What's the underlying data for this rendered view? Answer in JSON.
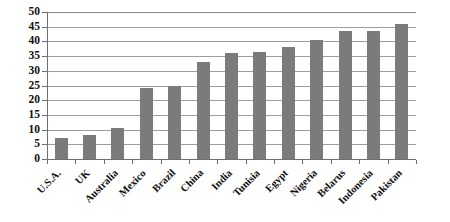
{
  "chart_data": {
    "type": "bar",
    "title": "",
    "subtitle": "",
    "xlabel": "",
    "ylabel": "",
    "ylim": [
      0,
      50
    ],
    "y_ticks": [
      0,
      5,
      10,
      15,
      20,
      25,
      30,
      35,
      40,
      45,
      50
    ],
    "grid": true,
    "legend": false,
    "legend_position": "none",
    "bar_color": "#7b7b7b",
    "categories": [
      "U.S.A.",
      "UK",
      "Australia",
      "Mexico",
      "Brazil",
      "China",
      "India",
      "Tunisia",
      "Egypt",
      "Nigeria",
      "Belarus",
      "Indonesia",
      "Pakistan"
    ],
    "values": [
      7,
      8,
      10.5,
      24,
      25,
      33,
      36,
      36.5,
      38,
      40.5,
      43.5,
      43.5,
      46
    ]
  },
  "axis": {
    "y_tick_labels": [
      "50",
      "45",
      "40",
      "35",
      "30",
      "25",
      "20",
      "15",
      "10",
      "5",
      "0"
    ]
  }
}
